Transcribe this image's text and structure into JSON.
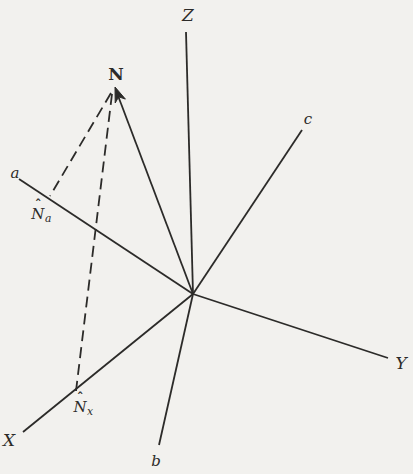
{
  "figure": {
    "background_color": "#f2f1ee",
    "ink_color": "#2c2b29",
    "width": 413,
    "height": 474,
    "origin": {
      "x": 193,
      "y": 294
    }
  },
  "labels": {
    "z": {
      "text": "Z",
      "x": 188,
      "y": 15
    },
    "n": {
      "text": "N",
      "x": 116,
      "y": 74
    },
    "c": {
      "text": "c",
      "x": 308,
      "y": 119
    },
    "a": {
      "text": "a",
      "x": 15,
      "y": 173
    },
    "y": {
      "text": "Y",
      "x": 401,
      "y": 363
    },
    "x": {
      "text": "X",
      "x": 9,
      "y": 440
    },
    "b": {
      "text": "b",
      "x": 156,
      "y": 461
    },
    "na": {
      "main": "N",
      "hat": "ˆ",
      "sub": "a",
      "x": 41,
      "y": 214
    },
    "nx": {
      "main": "N",
      "hat": "ˆ",
      "sub": "x",
      "x": 83,
      "y": 407
    }
  },
  "diagram": {
    "stroke_width": 1.8,
    "dash_pattern": "11 6",
    "lines": [
      {
        "name": "z-axis-line",
        "x1": 186,
        "y1": 32,
        "x2": 193,
        "y2": 294,
        "dashed": false
      },
      {
        "name": "c-axis-line",
        "x1": 302,
        "y1": 130,
        "x2": 193,
        "y2": 294,
        "dashed": false
      },
      {
        "name": "y-axis-line",
        "x1": 193,
        "y1": 294,
        "x2": 388,
        "y2": 358,
        "dashed": false
      },
      {
        "name": "x-axis-line",
        "x1": 193,
        "y1": 294,
        "x2": 23,
        "y2": 432,
        "dashed": false
      },
      {
        "name": "b-axis-line",
        "x1": 193,
        "y1": 294,
        "x2": 159,
        "y2": 445,
        "dashed": false
      },
      {
        "name": "a-axis-line",
        "x1": 19,
        "y1": 179,
        "x2": 193,
        "y2": 294,
        "dashed": false
      },
      {
        "name": "n-vector-line",
        "x1": 193,
        "y1": 294,
        "x2": 117,
        "y2": 93,
        "dashed": false
      },
      {
        "name": "projection-n-to-a",
        "x1": 111,
        "y1": 93,
        "x2": 50,
        "y2": 196,
        "dashed": true
      },
      {
        "name": "projection-n-to-x",
        "x1": 112,
        "y1": 94,
        "x2": 76,
        "y2": 391,
        "dashed": true
      }
    ],
    "arrowhead": {
      "name": "n-vector-arrowhead",
      "points": "115,87 125.4,99.1 118.7,96.8 115.2,103"
    }
  }
}
